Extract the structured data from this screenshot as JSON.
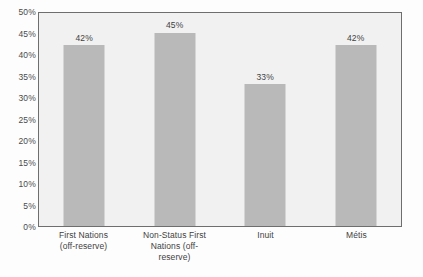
{
  "chart_data": {
    "type": "bar",
    "title": "",
    "subtitle": "",
    "xlabel": "",
    "ylabel": "",
    "categories": [
      "First Nations (off-reserve)",
      "Non-Status First Nations (off-reserve)",
      "Inuit",
      "Métis"
    ],
    "category_lines": [
      [
        "First Nations",
        "(off-reserve)"
      ],
      [
        "Non-Status First",
        "Nations (off-",
        "reserve)"
      ],
      [
        "Inuit"
      ],
      [
        "Métis"
      ]
    ],
    "values": [
      42,
      45,
      33,
      42
    ],
    "value_labels": [
      "42%",
      "45%",
      "33%",
      "42%"
    ],
    "ylim": [
      0,
      50
    ],
    "ytick_step": 5,
    "ytick_labels": [
      "50%",
      "45%",
      "40%",
      "35%",
      "30%",
      "25%",
      "20%",
      "15%",
      "10%",
      "5%",
      "0%"
    ],
    "ytick_values": [
      50,
      45,
      40,
      35,
      30,
      25,
      20,
      15,
      10,
      5,
      0
    ],
    "grid": false,
    "legend": null,
    "legend_position": "none",
    "colors": {
      "bar_fill": "#b9b9b9",
      "plot_background": "#f1f1f1",
      "plot_border": "#6e6e6e",
      "page_background": "#fdfdfd",
      "tick_text": "#4a4a4a",
      "label_text": "#3f3f3f"
    }
  }
}
